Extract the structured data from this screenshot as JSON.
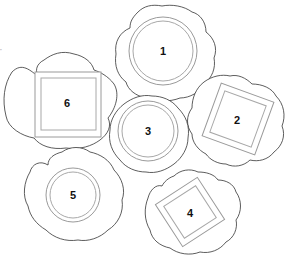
{
  "diagram": {
    "type": "table-layout-plan",
    "stroke_color": "#333333",
    "frame_color": "#9a9a9a",
    "edge_fragment": "”",
    "items": [
      {
        "id": "1",
        "label": "1",
        "shape": "round",
        "cx": 163,
        "cy": 51
      },
      {
        "id": "2",
        "label": "2",
        "shape": "square",
        "cx": 238,
        "cy": 119,
        "rotation": 20
      },
      {
        "id": "3",
        "label": "3",
        "shape": "round",
        "cx": 148,
        "cy": 131
      },
      {
        "id": "4",
        "label": "4",
        "shape": "square",
        "cx": 190,
        "cy": 212,
        "rotation": -33
      },
      {
        "id": "5",
        "label": "5",
        "shape": "round",
        "cx": 73,
        "cy": 195
      },
      {
        "id": "6",
        "label": "6",
        "shape": "square",
        "cx": 67,
        "cy": 104,
        "rotation": 0
      }
    ]
  }
}
